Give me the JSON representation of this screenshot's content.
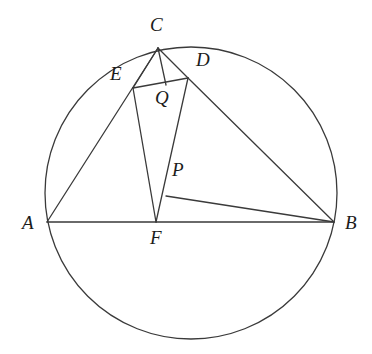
{
  "figure": {
    "kind": "euclidean-geometry-diagram",
    "canvas": {
      "width": 372,
      "height": 354
    },
    "background_color": "#ffffff",
    "stroke_color": "#3a3a3a",
    "label_color": "#1b1b1b",
    "circle": {
      "cx": 191,
      "cy": 193,
      "r": 146,
      "stroke_width": 1.3
    },
    "points": [
      {
        "id": "A",
        "label": "A",
        "x": 47,
        "y": 222,
        "label_x": 22,
        "label_y": 213,
        "on_circle": true
      },
      {
        "id": "B",
        "label": "B",
        "x": 334,
        "y": 222,
        "label_x": 345,
        "label_y": 213,
        "on_circle": true
      },
      {
        "id": "C",
        "label": "C",
        "x": 158,
        "y": 48,
        "label_x": 150,
        "label_y": 15,
        "on_circle": true
      },
      {
        "id": "D",
        "label": "D",
        "x": 188,
        "y": 78,
        "label_x": 196,
        "label_y": 50,
        "on_circle": true
      },
      {
        "id": "E",
        "label": "E",
        "x": 133,
        "y": 88,
        "label_x": 110,
        "label_y": 64,
        "on_circle": true
      },
      {
        "id": "F",
        "label": "F",
        "x": 156,
        "y": 222,
        "label_x": 150,
        "label_y": 228,
        "on_circle": false
      },
      {
        "id": "P",
        "label": "P",
        "x": 166,
        "y": 196,
        "label_x": 172,
        "label_y": 160,
        "on_circle": false
      },
      {
        "id": "Q",
        "label": "Q",
        "x": 166,
        "y": 85,
        "label_x": 155,
        "label_y": 88,
        "on_circle": false
      }
    ],
    "segments": [
      {
        "id": "AB",
        "from": "A",
        "to": "B"
      },
      {
        "id": "AC",
        "from": "A",
        "to": "C"
      },
      {
        "id": "CE",
        "from": "C",
        "to": "E"
      },
      {
        "id": "CQ",
        "from": "C",
        "to": "Q"
      },
      {
        "id": "CD",
        "from": "C",
        "to": "D"
      },
      {
        "id": "ED",
        "from": "E",
        "to": "D"
      },
      {
        "id": "EF",
        "from": "E",
        "to": "F"
      },
      {
        "id": "DF",
        "from": "D",
        "to": "F"
      },
      {
        "id": "DB",
        "from": "D",
        "to": "B"
      },
      {
        "id": "PB",
        "from": "P",
        "to": "B"
      }
    ]
  }
}
